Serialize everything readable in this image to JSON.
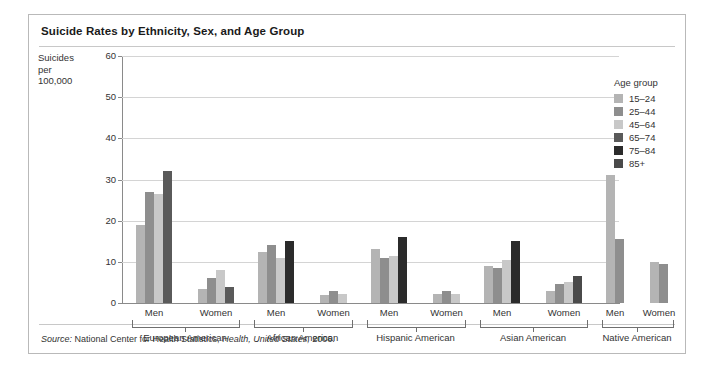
{
  "figure": {
    "title": "Suicide Rates by Ethnicity, Sex, and Age Group",
    "source_prefix": "Source:",
    "source_text": "National Center for Health Statistics,",
    "source_italic": "Health, United States,",
    "source_year": "2006."
  },
  "legend": {
    "title": "Age group",
    "entries": [
      {
        "label": "15–24",
        "color": "#b4b4b4"
      },
      {
        "label": "25–44",
        "color": "#8e8e8e"
      },
      {
        "label": "45–64",
        "color": "#c8c8c8"
      },
      {
        "label": "65–74",
        "color": "#5a5a5a"
      },
      {
        "label": "75–84",
        "color": "#2b2b2b"
      },
      {
        "label": "85+",
        "color": "#4a4a4a"
      }
    ]
  },
  "chart_data": {
    "type": "bar",
    "title": "Suicide Rates by Ethnicity, Sex, and Age Group",
    "xlabel": "",
    "ylabel": "Suicides per 100,000",
    "ylabel_lines": [
      "Suicides",
      "per",
      "100,000"
    ],
    "ylim": [
      0,
      60
    ],
    "yticks": [
      0,
      10,
      20,
      30,
      40,
      50,
      60
    ],
    "grid": true,
    "legend_position": "right",
    "series": [
      {
        "name": "15–24",
        "color": "#b4b4b4"
      },
      {
        "name": "25–44",
        "color": "#8e8e8e"
      },
      {
        "name": "45–64",
        "color": "#c8c8c8"
      },
      {
        "name": "65–74",
        "color": "#5a5a5a"
      },
      {
        "name": "75–84",
        "color": "#2b2b2b"
      },
      {
        "name": "85+",
        "color": "#4a4a4a"
      }
    ],
    "groups": [
      {
        "ethnicity": "European American",
        "sexes": [
          {
            "sex": "Men",
            "bars": [
              {
                "age": "15–24",
                "value": 19,
                "color": "#b4b4b4"
              },
              {
                "age": "25–44",
                "value": 27,
                "color": "#8e8e8e"
              },
              {
                "age": "45–64",
                "value": 26.5,
                "color": "#c8c8c8"
              },
              {
                "age": "65–74",
                "value": 32,
                "color": "#5a5a5a"
              }
            ]
          },
          {
            "sex": "Women",
            "bars": [
              {
                "age": "15–24",
                "value": 3.5,
                "color": "#b4b4b4"
              },
              {
                "age": "25–44",
                "value": 6,
                "color": "#8e8e8e"
              },
              {
                "age": "45–64",
                "value": 8,
                "color": "#c8c8c8"
              },
              {
                "age": "65–74",
                "value": 4,
                "color": "#5a5a5a"
              }
            ]
          }
        ]
      },
      {
        "ethnicity": "African American",
        "sexes": [
          {
            "sex": "Men",
            "bars": [
              {
                "age": "15–24",
                "value": 12.5,
                "color": "#b4b4b4"
              },
              {
                "age": "25–44",
                "value": 14,
                "color": "#8e8e8e"
              },
              {
                "age": "45–64",
                "value": 11,
                "color": "#c8c8c8"
              },
              {
                "age": "65–74",
                "value": 15,
                "color": "#2b2b2b"
              }
            ]
          },
          {
            "sex": "Women",
            "bars": [
              {
                "age": "15–24",
                "value": 2,
                "color": "#b4b4b4"
              },
              {
                "age": "25–44",
                "value": 2.8,
                "color": "#8e8e8e"
              },
              {
                "age": "45–64",
                "value": 2.2,
                "color": "#c8c8c8"
              }
            ]
          }
        ]
      },
      {
        "ethnicity": "Hispanic American",
        "sexes": [
          {
            "sex": "Men",
            "bars": [
              {
                "age": "15–24",
                "value": 13,
                "color": "#b4b4b4"
              },
              {
                "age": "25–44",
                "value": 11,
                "color": "#8e8e8e"
              },
              {
                "age": "45–64",
                "value": 11.5,
                "color": "#c8c8c8"
              },
              {
                "age": "65–74",
                "value": 16,
                "color": "#2b2b2b"
              }
            ]
          },
          {
            "sex": "Women",
            "bars": [
              {
                "age": "15–24",
                "value": 2.2,
                "color": "#b4b4b4"
              },
              {
                "age": "25–44",
                "value": 3,
                "color": "#8e8e8e"
              },
              {
                "age": "45–64",
                "value": 2.3,
                "color": "#c8c8c8"
              }
            ]
          }
        ]
      },
      {
        "ethnicity": "Asian American",
        "sexes": [
          {
            "sex": "Men",
            "bars": [
              {
                "age": "15–24",
                "value": 9,
                "color": "#b4b4b4"
              },
              {
                "age": "25–44",
                "value": 8.5,
                "color": "#8e8e8e"
              },
              {
                "age": "45–64",
                "value": 10.5,
                "color": "#c8c8c8"
              },
              {
                "age": "65–74",
                "value": 15,
                "color": "#2b2b2b"
              }
            ]
          },
          {
            "sex": "Women",
            "bars": [
              {
                "age": "15–24",
                "value": 3,
                "color": "#b4b4b4"
              },
              {
                "age": "25–44",
                "value": 4.5,
                "color": "#8e8e8e"
              },
              {
                "age": "45–64",
                "value": 5,
                "color": "#c8c8c8"
              },
              {
                "age": "65–74",
                "value": 6.5,
                "color": "#4a4a4a"
              }
            ]
          }
        ]
      },
      {
        "ethnicity": "Native American",
        "sexes": [
          {
            "sex": "Men",
            "bars": [
              {
                "age": "15–24",
                "value": 31,
                "color": "#b4b4b4"
              },
              {
                "age": "25–44",
                "value": 15.5,
                "color": "#8e8e8e"
              }
            ]
          },
          {
            "sex": "Women",
            "bars": [
              {
                "age": "15–24",
                "value": 10,
                "color": "#b4b4b4"
              },
              {
                "age": "25–44",
                "value": 9.5,
                "color": "#8e8e8e"
              }
            ]
          }
        ]
      }
    ]
  }
}
